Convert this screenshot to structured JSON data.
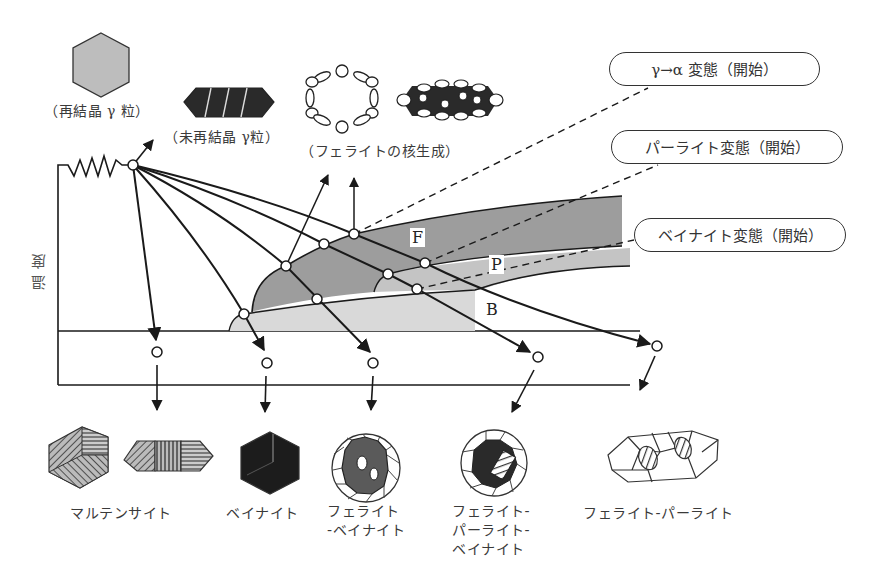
{
  "diagram": {
    "type": "CCT diagram (continuous cooling transformation) with microstructure schematics",
    "y_axis_label": "温度",
    "regions": {
      "ferrite": "F",
      "pearlite": "P",
      "bainite": "B"
    },
    "callouts": {
      "gamma_alpha": "γ→α 変態（開始）",
      "pearlite": "パーライト変態（開始）",
      "bainite": "ベイナイト変態（開始）"
    },
    "top_labels": {
      "recrystallized": "（再結晶 γ 粒）",
      "unrecrystallized": "（未再結晶 γ粒）",
      "ferrite_nucleation": "（フェライトの核生成）"
    },
    "products": [
      {
        "label": "マルテンサイト"
      },
      {
        "label": "ベイナイト"
      },
      {
        "label": "フェライト\n-ベイナイト"
      },
      {
        "label": "フェライト-\nパーライト-\nベイナイト"
      },
      {
        "label": "フェライト-パーライト"
      }
    ],
    "colors": {
      "ferrite_region": "#9a9a9a",
      "pearlite_region": "#c4c4c4",
      "bainite_region": "#d9d9d9",
      "line": "#1a1a1a"
    }
  }
}
